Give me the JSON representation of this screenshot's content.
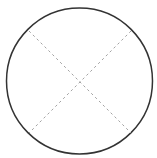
{
  "diagram": {
    "background_color": "#ffffff",
    "circle": {
      "cx": 79.5,
      "cy": 81,
      "r": 73,
      "stroke_color": "#333333",
      "stroke_width": 1.5
    },
    "dashed_lines": [
      {
        "x1": 29,
        "y1": 31,
        "x2": 131,
        "y2": 133
      },
      {
        "x1": 131,
        "y1": 31,
        "x2": 29,
        "y2": 133
      }
    ],
    "dashed_line_style": {
      "stroke_color": "#a3a3a3",
      "stroke_width": 1,
      "dash_pattern": "2.5 3"
    }
  }
}
